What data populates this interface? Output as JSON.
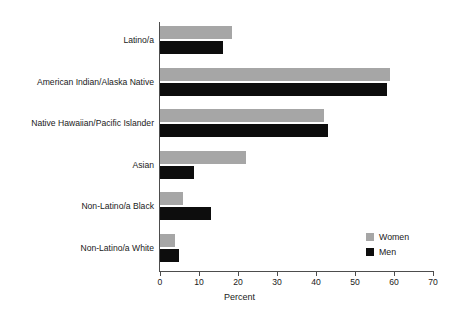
{
  "chart_data": {
    "type": "bar",
    "orientation": "horizontal",
    "title": "",
    "xlabel": "Percent",
    "ylabel": "",
    "xlim": [
      0,
      70
    ],
    "xticks": [
      0,
      10,
      20,
      30,
      40,
      50,
      60,
      70
    ],
    "xtick_labels": [
      "0",
      "10",
      "20",
      "30",
      "40",
      "50",
      "60",
      "70"
    ],
    "grid": false,
    "legend_position": "bottom-right",
    "categories": [
      "Latino/a",
      "American Indian/Alaska Native",
      "Native Hawaiian/Pacific Islander",
      "Asian",
      "Non-Latino/a Black",
      "Non-Latino/a White"
    ],
    "series": [
      {
        "name": "Women",
        "color": "#a6a6a6",
        "values": [
          18.5,
          59.0,
          42.0,
          22.0,
          5.8,
          3.8
        ]
      },
      {
        "name": "Men",
        "color": "#0d0d0d",
        "values": [
          16.2,
          58.2,
          43.1,
          8.8,
          13.0,
          4.9
        ]
      }
    ]
  },
  "legend": {
    "items": [
      {
        "label": "Women",
        "color": "#a6a6a6"
      },
      {
        "label": "Men",
        "color": "#0d0d0d"
      }
    ]
  },
  "axis": {
    "x_title": "Percent"
  }
}
